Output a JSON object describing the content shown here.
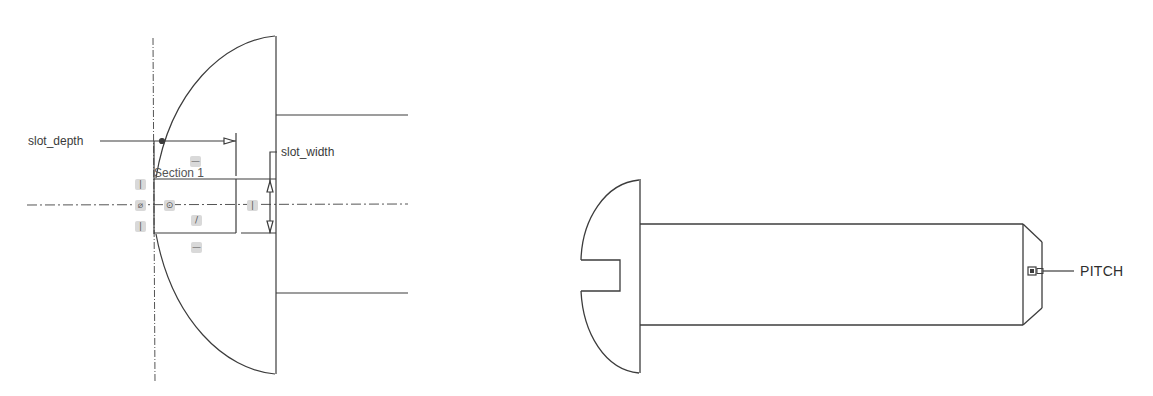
{
  "left_view": {
    "title": "Sketch view of screw head with slot",
    "dimensions": {
      "slot_depth": "slot_depth",
      "slot_width": "slot_width"
    },
    "section_label": "Section 1",
    "constraint_icons": [
      {
        "name": "vertical-constraint-icon",
        "glyph": "|"
      },
      {
        "name": "tangent-constraint-icon",
        "glyph": "⌀"
      },
      {
        "name": "vertical-constraint-icon",
        "glyph": "|"
      },
      {
        "name": "coincident-constraint-icon",
        "glyph": "⊙"
      },
      {
        "name": "horizontal-constraint-icon",
        "glyph": "—"
      },
      {
        "name": "diagonal-constraint-icon",
        "glyph": "/"
      },
      {
        "name": "horizontal-constraint-icon",
        "glyph": "—"
      },
      {
        "name": "vertical-constraint-icon",
        "glyph": "|"
      }
    ]
  },
  "right_view": {
    "title": "Side view of slotted round-head screw",
    "annotation": "PITCH"
  },
  "colors": {
    "line": "#3c3c3c",
    "centerline": "#555555",
    "constraint_bg": "#d9d9d9",
    "text": "#3a3a3a"
  }
}
